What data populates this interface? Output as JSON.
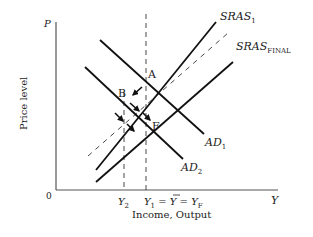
{
  "diagram": {
    "type": "AD-AS model",
    "axes": {
      "y_label": "Price level",
      "y_symbol": "P",
      "x_label": "Income, Output",
      "x_symbol": "Y",
      "origin": "0"
    },
    "curves": {
      "sras1": {
        "name": "SRAS",
        "sub": "1"
      },
      "sras_final": {
        "name": "SRAS",
        "sub": "FINAL"
      },
      "ad1": {
        "name": "AD",
        "sub": "1"
      },
      "ad2": {
        "name": "AD",
        "sub": "2"
      }
    },
    "points": {
      "a": "A",
      "b": "B",
      "f": "F"
    },
    "x_ticks": {
      "y2": {
        "name": "Y",
        "sub": "2"
      },
      "y1": {
        "main": "Y",
        "sub1": "1",
        "eq1": " = ",
        "ybar": "Y",
        "eq2": " = ",
        "yf": "Y",
        "subf": "F"
      }
    },
    "colors": {
      "line": "#111111",
      "axis": "#555555",
      "text": "#222222"
    }
  }
}
